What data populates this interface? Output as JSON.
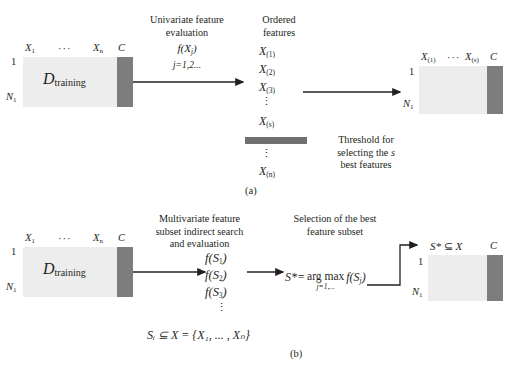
{
  "figure": {
    "panel_a_label": "(a)",
    "panel_b_label": "(b)"
  },
  "panel_a": {
    "input_matrix": {
      "name": "D",
      "name_sub": "training",
      "col_first": "X",
      "col_first_sub": "1",
      "col_dots": "···",
      "col_last": "X",
      "col_last_sub": "n",
      "col_class": "C",
      "row_first": "1",
      "row_last": "N",
      "row_last_sub": "1"
    },
    "step1_caption_line1": "Univariate feature",
    "step1_caption_line2": "evaluation",
    "step1_formula": "f(X",
    "step1_formula_sub": "j",
    "step1_formula_close": ")",
    "step1_index": "j=1,2...",
    "ordered_caption_line1": "Ordered",
    "ordered_caption_line2": "features",
    "ordered_features": [
      {
        "base": "X",
        "sub": "(1)"
      },
      {
        "base": "X",
        "sub": "(2)"
      },
      {
        "base": "X",
        "sub": "(3)"
      },
      {
        "base": "X",
        "sub": "(s)"
      },
      {
        "base": "X",
        "sub": "(n)"
      }
    ],
    "vdots": "⋮",
    "threshold_line1": "Threshold for",
    "threshold_line2_a": "selecting the ",
    "threshold_line2_italic": "s",
    "threshold_line3": "best features",
    "output_matrix": {
      "col_first": "X",
      "col_first_sub": "(1)",
      "col_dots": "···",
      "col_last": "X",
      "col_last_sub": "(s)",
      "col_class": "C",
      "row_first": "1",
      "row_last": "N",
      "row_last_sub": "1"
    }
  },
  "panel_b": {
    "input_matrix": {
      "name": "D",
      "name_sub": "training",
      "col_first": "X",
      "col_first_sub": "1",
      "col_dots": "···",
      "col_last": "X",
      "col_last_sub": "n",
      "col_class": "C",
      "row_first": "1",
      "row_last": "N",
      "row_last_sub": "1"
    },
    "step1_caption_line1": "Multivariate feature",
    "step1_caption_line2": "subset indirect search",
    "step1_caption_line3": "and evaluation",
    "subset_evals": [
      {
        "base": "f(S",
        "sub": "1",
        "close": ")"
      },
      {
        "base": "f(S",
        "sub": "2",
        "close": ")"
      },
      {
        "base": "f(S",
        "sub": "3",
        "close": ")"
      }
    ],
    "vdots": "⋮",
    "subset_def": "Sᵢ ⊆ X = {X₁, ... , Xₙ}",
    "step2_caption_line1": "Selection of the best",
    "step2_caption_line2": "feature subset",
    "argmax_lhs": "S*=",
    "argmax_op": "arg max",
    "argmax_index": "j=1,...",
    "argmax_rhs_base": "f(S",
    "argmax_rhs_sub": "j",
    "argmax_rhs_close": ")",
    "output_matrix": {
      "col_label_star": "S*",
      "col_label_subset": "⊆",
      "col_label_x": "X",
      "col_class": "C",
      "row_first": "1",
      "row_last": "N",
      "row_last_sub": "1"
    }
  },
  "colors": {
    "matrix_body": "#ededed",
    "matrix_class": "#7d7d7d",
    "threshold_bar": "#6f6f6f",
    "ink": "#231f20"
  }
}
